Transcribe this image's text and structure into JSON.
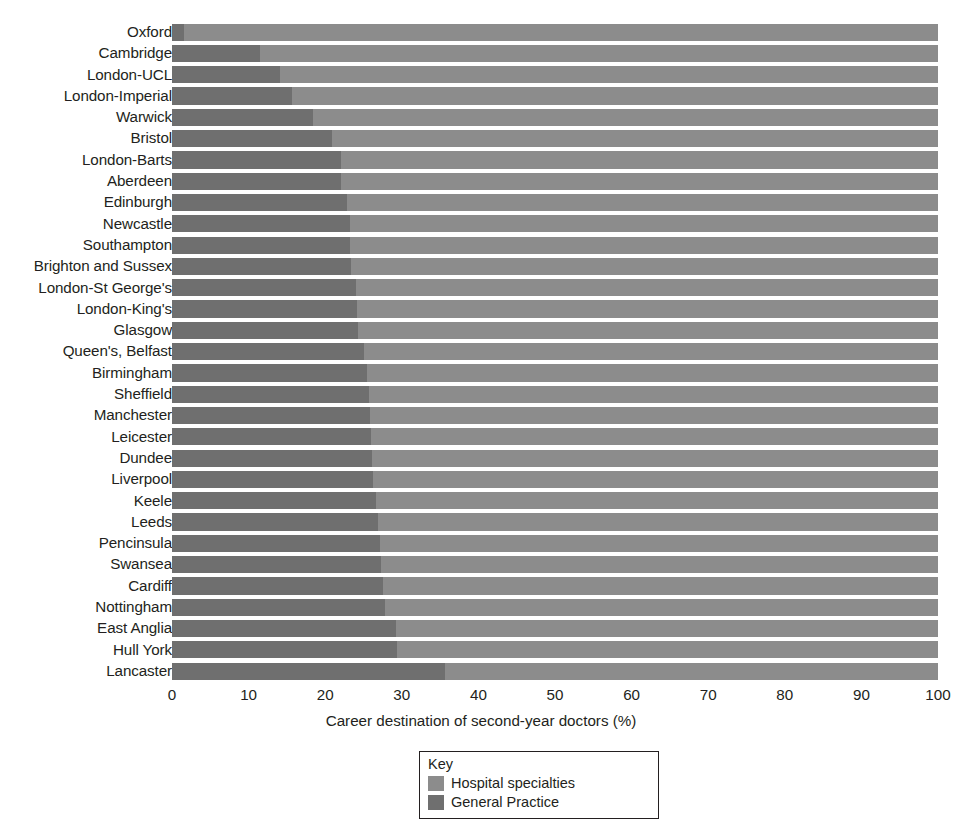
{
  "chart_data": {
    "type": "bar",
    "orientation": "horizontal",
    "stacked": true,
    "stacked_total": 100,
    "title": "",
    "xlabel": "Career destination of second-year doctors (%)",
    "ylabel": "",
    "xlim": [
      0,
      100
    ],
    "xticks": [
      0,
      10,
      20,
      30,
      40,
      50,
      60,
      70,
      80,
      90,
      100
    ],
    "xticklabels": [
      "0",
      "10",
      "20",
      "30",
      "40",
      "50",
      "60",
      "70",
      "80",
      "90",
      "100"
    ],
    "grid": false,
    "legend_position": "bottom-center",
    "legend_title": "Key",
    "categories": [
      "Oxford",
      "Cambridge",
      "London-UCL",
      "London-Imperial",
      "Warwick",
      "Bristol",
      "London-Barts",
      "Aberdeen",
      "Edinburgh",
      "Newcastle",
      "Southampton",
      "Brighton and Sussex",
      "London-St George's",
      "London-King's",
      "Glasgow",
      "Queen's, Belfast",
      "Birmingham",
      "Sheffield",
      "Manchester",
      "Leicester",
      "Dundee",
      "Liverpool",
      "Keele",
      "Leeds",
      "Pencinsula",
      "Swansea",
      "Cardiff",
      "Nottingham",
      "East Anglia",
      "Hull York",
      "Lancaster"
    ],
    "series": [
      {
        "name": "General Practice",
        "color": "#6f6f6f",
        "values": [
          1.6,
          11.5,
          14.1,
          15.7,
          18.4,
          20.9,
          22.0,
          22.1,
          22.9,
          23.2,
          23.3,
          23.4,
          24.0,
          24.1,
          24.3,
          25.0,
          25.4,
          25.7,
          25.8,
          26.0,
          26.1,
          26.3,
          26.6,
          26.9,
          27.2,
          27.3,
          27.5,
          27.8,
          29.3,
          29.4,
          35.6
        ]
      },
      {
        "name": "Hospital specialties",
        "color": "#8c8c8c",
        "values": [
          98.4,
          88.5,
          85.9,
          84.3,
          81.6,
          79.1,
          78.0,
          77.9,
          77.1,
          76.8,
          76.7,
          76.6,
          76.0,
          75.9,
          75.7,
          75.0,
          74.6,
          74.3,
          74.2,
          74.0,
          73.9,
          73.7,
          73.4,
          73.1,
          72.8,
          72.7,
          72.5,
          72.2,
          70.7,
          70.6,
          64.4
        ]
      }
    ]
  },
  "legend": {
    "title": "Key",
    "items": [
      {
        "label": "Hospital specialties",
        "color": "#8c8c8c"
      },
      {
        "label": "General Practice",
        "color": "#6f6f6f"
      }
    ]
  }
}
